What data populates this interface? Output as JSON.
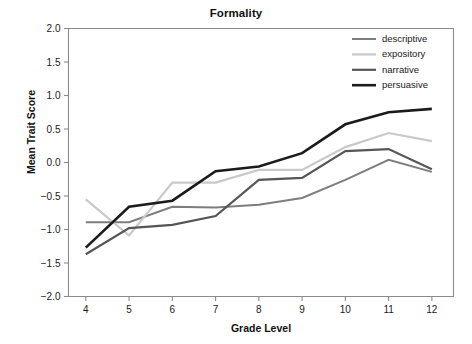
{
  "chart_data": {
    "type": "line",
    "title": "Formality",
    "xlabel": "Grade Level",
    "ylabel": "Mean Trait Score",
    "x": [
      4,
      5,
      6,
      7,
      8,
      9,
      10,
      11,
      12
    ],
    "categories": [
      "4",
      "5",
      "6",
      "7",
      "8",
      "9",
      "10",
      "11",
      "12"
    ],
    "xlim": [
      3.6,
      12.5
    ],
    "ylim": [
      -2.0,
      2.0
    ],
    "yticks": [
      -2.0,
      -1.5,
      -1.0,
      -0.5,
      0.0,
      0.5,
      1.0,
      1.5,
      2.0
    ],
    "ytick_labels": [
      "−2.0",
      "−1.5",
      "−1.0",
      "−0.5",
      "0.0",
      "0.5",
      "1.0",
      "1.5",
      "2.0"
    ],
    "grid": false,
    "legend_position": "top-right",
    "series": [
      {
        "name": "descriptive",
        "color": "#7d7d7d",
        "width": 2.0,
        "values": [
          -0.89,
          -0.89,
          -0.66,
          -0.67,
          -0.63,
          -0.53,
          -0.26,
          0.04,
          -0.14
        ]
      },
      {
        "name": "expository",
        "color": "#c9c9c9",
        "width": 2.2,
        "values": [
          -0.55,
          -1.09,
          -0.3,
          -0.3,
          -0.11,
          -0.11,
          0.23,
          0.44,
          0.32
        ]
      },
      {
        "name": "narrative",
        "color": "#565656",
        "width": 2.2,
        "values": [
          -1.37,
          -0.98,
          -0.93,
          -0.8,
          -0.26,
          -0.23,
          0.17,
          0.2,
          -0.1
        ]
      },
      {
        "name": "persuasive",
        "color": "#1b1b1b",
        "width": 2.6,
        "values": [
          -1.27,
          -0.66,
          -0.57,
          -0.13,
          -0.06,
          0.14,
          0.57,
          0.75,
          0.8
        ]
      }
    ]
  },
  "legend": {
    "entries": [
      {
        "label": "descriptive"
      },
      {
        "label": "expository"
      },
      {
        "label": "narrative"
      },
      {
        "label": "persuasive"
      }
    ]
  },
  "axes": {
    "frame_color": "#8b8b8b"
  }
}
